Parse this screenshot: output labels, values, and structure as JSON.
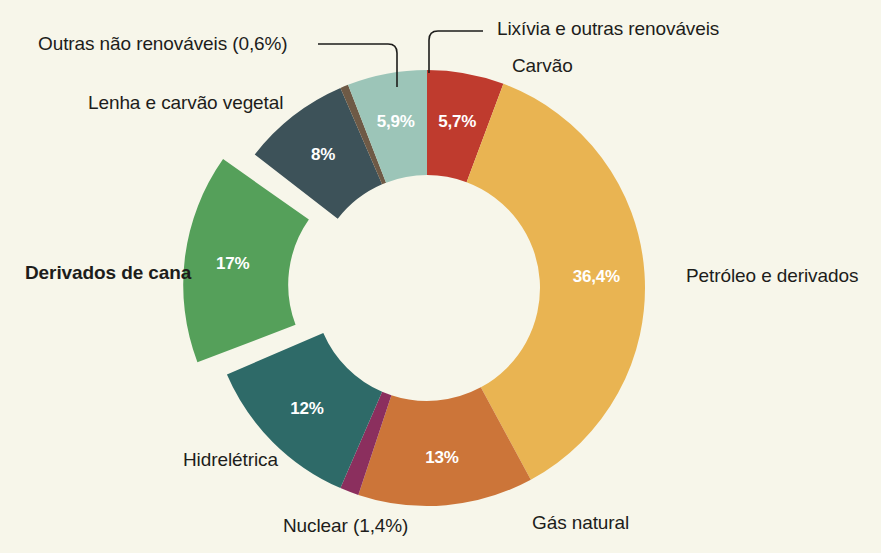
{
  "background_color": "#f7f6ea",
  "chart_data": {
    "type": "pie",
    "variant": "donut",
    "title": "",
    "subtitle": "",
    "xlabel": "",
    "ylabel": "",
    "legend_position": "callout-labels",
    "grid": false,
    "total": 100,
    "categories": [
      "Carvão",
      "Petróleo e derivados",
      "Gás natural",
      "Nuclear (1,4%)",
      "Hidrelétrica",
      "Derivados de cana",
      "Lenha e carvão vegetal",
      "Outras não renováveis (0,6%)",
      "Lixívia e outras renováveis"
    ],
    "values": [
      5.7,
      36.4,
      13.0,
      1.4,
      12.0,
      17.0,
      8.0,
      0.6,
      5.9
    ],
    "value_labels": [
      "5,7%",
      "36,4%",
      "13%",
      "",
      "12%",
      "17%",
      "8%",
      "",
      "5,9%"
    ],
    "colors": [
      "#bf3b2e",
      "#e9b452",
      "#cc7539",
      "#8b2f5e",
      "#2e6a68",
      "#55a05a",
      "#3d5259",
      "#6e5a46",
      "#9cc5b8"
    ],
    "exploded": [
      "Derivados de cana"
    ],
    "slices": [
      {
        "name": "Carvão",
        "value": 5.7,
        "label": "5,7%",
        "color": "#bf3b2e",
        "text_color": "#ffffff",
        "has_callout": false,
        "exploded": false
      },
      {
        "name": "Petróleo e derivados",
        "value": 36.4,
        "label": "36,4%",
        "color": "#e9b452",
        "text_color": "#ffffff",
        "has_callout": false,
        "exploded": false
      },
      {
        "name": "Gás natural",
        "value": 13.0,
        "label": "13%",
        "color": "#cc7539",
        "text_color": "#ffffff",
        "has_callout": false,
        "exploded": false
      },
      {
        "name": "Nuclear (1,4%)",
        "value": 1.4,
        "label": "",
        "color": "#8b2f5e",
        "text_color": "#ffffff",
        "has_callout": false,
        "exploded": false
      },
      {
        "name": "Hidrelétrica",
        "value": 12.0,
        "label": "12%",
        "color": "#2e6a68",
        "text_color": "#ffffff",
        "has_callout": false,
        "exploded": false
      },
      {
        "name": "Derivados de cana",
        "value": 17.0,
        "label": "17%",
        "color": "#55a05a",
        "text_color": "#ffffff",
        "has_callout": false,
        "exploded": true
      },
      {
        "name": "Lenha e carvão vegetal",
        "value": 8.0,
        "label": "8%",
        "color": "#3d5259",
        "text_color": "#ffffff",
        "has_callout": false,
        "exploded": false
      },
      {
        "name": "Outras não renováveis (0,6%)",
        "value": 0.6,
        "label": "",
        "color": "#6e5a46",
        "text_color": "#ffffff",
        "has_callout": true,
        "exploded": false
      },
      {
        "name": "Lixívia e outras renováveis",
        "value": 5.9,
        "label": "5,9%",
        "color": "#9cc5b8",
        "text_color": "#ffffff",
        "has_callout": true,
        "exploded": false
      }
    ]
  },
  "labels": {
    "outras_nao_renovaveis": "Outras não renováveis (0,6%)",
    "lenha_e_carvao_vegetal": "Lenha e carvão vegetal",
    "lixivia_e_outras_renovaveis": "Lixívia e outras renováveis",
    "carvao": "Carvão",
    "petroleo_e_derivados": "Petróleo e derivados",
    "gas_natural": "Gás natural",
    "nuclear": "Nuclear (1,4%)",
    "hidreletrica": "Hidrelétrica",
    "derivados_de_cana": "Derivados de cana"
  },
  "slice_values": {
    "lixivia": "5,9%",
    "carvao": "5,7%",
    "petroleo": "36,4%",
    "gas_natural": "13%",
    "hidreletrica": "12%",
    "derivados_de_cana": "17%",
    "lenha": "8%"
  }
}
